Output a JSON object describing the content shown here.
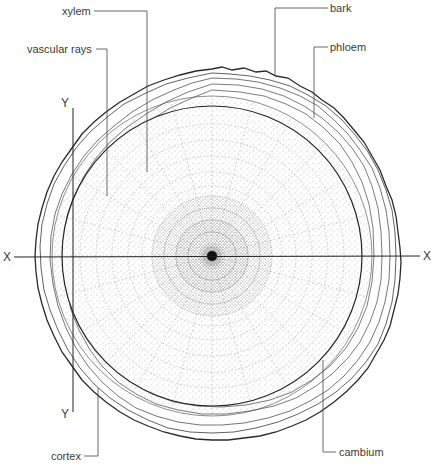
{
  "diagram": {
    "labels": {
      "xylem": "xylem",
      "vascular_rays": "vascular rays",
      "bark": "bark",
      "phloem": "phloem",
      "cortex": "cortex",
      "cambium": "cambium"
    },
    "axes": {
      "x_left": "X",
      "x_right": "X",
      "y_top": "Y",
      "y_bottom": "Y"
    },
    "colors": {
      "ink": "#2a2a2a",
      "stipple": "#6a6a6a",
      "background": "#ffffff"
    }
  }
}
